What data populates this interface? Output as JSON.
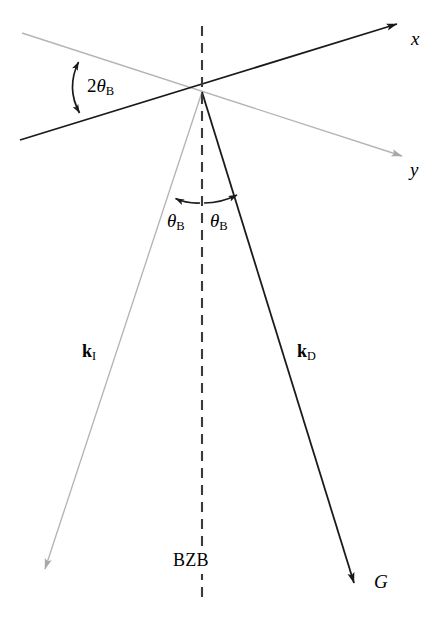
{
  "figure": {
    "width": 441,
    "height": 619,
    "background": "#ffffff"
  },
  "colors": {
    "black": "#1a1a1a",
    "dark": "#2b2b2b",
    "gray_light": "#b4b4b4",
    "gray_mid": "#9a9a9a",
    "dashed": "#3a3a3a",
    "background": "#ffffff"
  },
  "geometry": {
    "vertex": {
      "x": 202,
      "y": 92
    },
    "x_axis": {
      "from": {
        "x": 20,
        "y": 140
      },
      "to": {
        "x": 403,
        "y": 22
      }
    },
    "y_axis": {
      "from": {
        "x": 22,
        "y": 33
      },
      "to": {
        "x": 408,
        "y": 158
      }
    },
    "dashed_line": {
      "x": 202,
      "from_y": 26,
      "to_y": 600,
      "dash": 10,
      "gap": 7
    },
    "k_incident": {
      "from": {
        "x": 202,
        "y": 92
      },
      "to": {
        "x": 42,
        "y": 578
      }
    },
    "k_diffracted": {
      "from": {
        "x": 202,
        "y": 92
      },
      "to": {
        "x": 357,
        "y": 592
      }
    }
  },
  "labels": {
    "axis_x": "x",
    "axis_y": "y",
    "angle_two_theta_b": {
      "coefficient": "2",
      "symbol": "θ",
      "subscript": "B"
    },
    "angle_theta_b_left": {
      "symbol": "θ",
      "subscript": "B"
    },
    "angle_theta_b_right": {
      "symbol": "θ",
      "subscript": "B"
    },
    "vector_k_incident": {
      "symbol": "k",
      "subscript": "I"
    },
    "vector_k_diffracted": {
      "symbol": "k",
      "subscript": "D"
    },
    "brillouin_zone_boundary": "BZB",
    "reciprocal_lattice_vector": "G"
  },
  "annotations": {
    "arc_two_theta_b": {
      "start": {
        "x": 77,
        "y": 57
      },
      "end": {
        "x": 78,
        "y": 118
      },
      "double_headed": true
    },
    "arc_theta_b_left": {
      "start": {
        "x": 200,
        "y": 202
      },
      "end": {
        "x": 170,
        "y": 196
      },
      "double_headed": false
    },
    "arc_theta_b_right": {
      "start": {
        "x": 204,
        "y": 202
      },
      "end": {
        "x": 243,
        "y": 192
      },
      "double_headed": false
    }
  }
}
